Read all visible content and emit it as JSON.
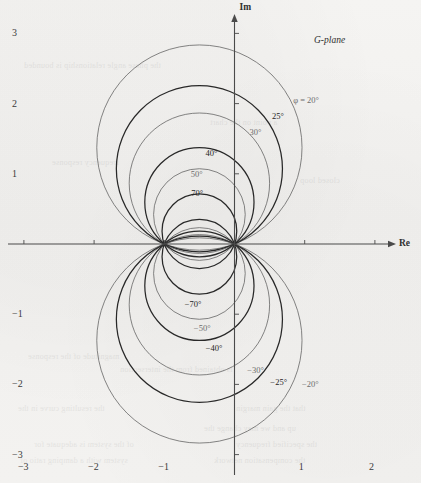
{
  "figure": {
    "plane_label": "G-plane",
    "axis_x_label": "Re",
    "axis_y_label": "Im"
  },
  "chart_data": {
    "type": "line",
    "xlabel": "Re",
    "ylabel": "Im",
    "xlim": [
      -3.35,
      2.45
    ],
    "ylim": [
      -3.45,
      3.4
    ],
    "xticks": [
      -3,
      -2,
      -1,
      1,
      2
    ],
    "yticks": [
      3,
      2,
      1,
      -1,
      -2,
      -3
    ],
    "xtick_labels": [
      "−3",
      "−2",
      "−1",
      "1",
      "2"
    ],
    "ytick_labels": [
      "3",
      "2",
      "1",
      "−1",
      "−2",
      "−3"
    ],
    "grid": false,
    "legend_position": "inline-annotations",
    "note": "Each curve is a circle of constant closed-loop phase φ, centre (-0.5, 0.5/tanφ), radius 0.5/|sinφ|, passing through the points 0 and -1.",
    "series": [
      {
        "name": "φ = 20°",
        "phi_deg": 20,
        "center": [
          -0.5,
          1.3737
        ],
        "radius": 1.4619,
        "weight": "light",
        "label": "φ = 20°",
        "label_xy": [
          1.02,
          2.05
        ]
      },
      {
        "name": "25°",
        "phi_deg": 25,
        "center": [
          -0.5,
          1.0724
        ],
        "radius": 1.1831,
        "weight": "bold",
        "label": "25°",
        "label_xy": [
          0.62,
          1.82
        ]
      },
      {
        "name": "30°",
        "phi_deg": 30,
        "center": [
          -0.5,
          0.866
        ],
        "radius": 1.0,
        "weight": "light",
        "label": "30°",
        "label_xy": [
          0.3,
          1.6
        ]
      },
      {
        "name": "40°",
        "phi_deg": 40,
        "center": [
          -0.5,
          0.5959
        ],
        "radius": 0.7779,
        "weight": "bold",
        "label": "40°",
        "label_xy": [
          -0.33,
          1.29
        ]
      },
      {
        "name": "50°",
        "phi_deg": 50,
        "center": [
          -0.5,
          0.4196
        ],
        "radius": 0.6527,
        "weight": "light",
        "label": "50°",
        "label_xy": [
          -0.54,
          1.0
        ]
      },
      {
        "name": "70°",
        "phi_deg": 70,
        "center": [
          -0.5,
          0.182
        ],
        "radius": 0.5321,
        "weight": "bold",
        "label": "70°",
        "label_xy": [
          -0.53,
          0.73
        ]
      },
      {
        "name": "−70°",
        "phi_deg": -70,
        "center": [
          -0.5,
          -0.182
        ],
        "radius": 0.5321,
        "weight": "bold",
        "label": "−70°",
        "label_xy": [
          -0.59,
          -0.85
        ]
      },
      {
        "name": "−50°",
        "phi_deg": -50,
        "center": [
          -0.5,
          -0.4196
        ],
        "radius": 0.6527,
        "weight": "light",
        "label": "−50°",
        "label_xy": [
          -0.46,
          -1.2
        ]
      },
      {
        "name": "−40°",
        "phi_deg": -40,
        "center": [
          -0.5,
          -0.5959
        ],
        "radius": 0.7779,
        "weight": "bold",
        "label": "−40°",
        "label_xy": [
          -0.29,
          -1.48
        ]
      },
      {
        "name": "−30°",
        "phi_deg": -30,
        "center": [
          -0.5,
          -0.866
        ],
        "radius": 1.0,
        "weight": "light",
        "label": "−30°",
        "label_xy": [
          0.3,
          -1.8
        ]
      },
      {
        "name": "−25°",
        "phi_deg": -25,
        "center": [
          -0.5,
          -1.0724
        ],
        "radius": 1.1831,
        "weight": "bold",
        "label": "−25°",
        "label_xy": [
          0.63,
          -1.96
        ]
      },
      {
        "name": "−20°",
        "phi_deg": -20,
        "center": [
          -0.5,
          -1.3737
        ],
        "radius": 1.4619,
        "weight": "light",
        "label": "−20°",
        "label_xy": [
          1.08,
          -2.0
        ]
      }
    ]
  },
  "ghost_text": [
    {
      "t": "the phase angle relationship is bounded",
      "x": 24,
      "y": 61
    },
    {
      "t": "a point on the chart",
      "x": 210,
      "y": 118
    },
    {
      "t": "frequency response",
      "x": 52,
      "y": 158
    },
    {
      "t": "closed loop",
      "x": 300,
      "y": 176
    },
    {
      "t": "magnitude of the response",
      "x": 28,
      "y": 352
    },
    {
      "t": "is obtained from the intersection",
      "x": 120,
      "y": 365
    },
    {
      "t": "the resulting curve in the",
      "x": 18,
      "y": 404
    },
    {
      "t": "that the gain margin",
      "x": 236,
      "y": 404
    },
    {
      "t": "up and we may change the",
      "x": 204,
      "y": 424
    },
    {
      "t": "of the system is adequate for",
      "x": 34,
      "y": 440
    },
    {
      "t": "the specified frequency",
      "x": 236,
      "y": 440
    },
    {
      "t": "system with a damping ratio of",
      "x": 20,
      "y": 456
    },
    {
      "t": "the compensation network",
      "x": 214,
      "y": 456
    }
  ]
}
